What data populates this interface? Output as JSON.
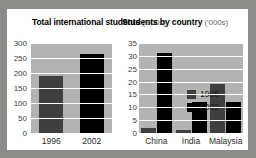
{
  "background_color": "#8d8d88",
  "card_color": "#ffffff",
  "series_colors": {
    "1996": "#3f3f3f",
    "2002": "#000000"
  },
  "legend": {
    "position": "inside-top-right",
    "entries": [
      {
        "label": "1996",
        "color": "#3f3f3f"
      },
      {
        "label": "2002",
        "color": "#000000"
      }
    ]
  },
  "chart_data": [
    {
      "id": "total-international-students",
      "type": "bar",
      "title": "Total international students",
      "units": "('000s)",
      "xlabel": "",
      "ylabel": "",
      "categories": [
        "1996",
        "2002"
      ],
      "values": [
        190,
        265
      ],
      "bar_colors": [
        "#3f3f3f",
        "#000000"
      ],
      "ylim": [
        0,
        300
      ],
      "yticks": [
        300,
        250,
        200,
        150,
        100,
        50,
        0
      ],
      "grid": true,
      "legend": false
    },
    {
      "id": "students-by-country",
      "type": "bar",
      "title": "Students by country",
      "units": "('000s)",
      "xlabel": "",
      "ylabel": "",
      "categories": [
        "China",
        "India",
        "Malaysia"
      ],
      "series": [
        {
          "name": "1996",
          "color": "#3f3f3f",
          "values": [
            2,
            1,
            19
          ]
        },
        {
          "name": "2002",
          "color": "#000000",
          "values": [
            31,
            12,
            12
          ]
        }
      ],
      "ylim": [
        0,
        35
      ],
      "yticks": [
        35,
        30,
        25,
        20,
        15,
        10,
        5,
        0
      ],
      "grid": true,
      "legend": true
    }
  ]
}
